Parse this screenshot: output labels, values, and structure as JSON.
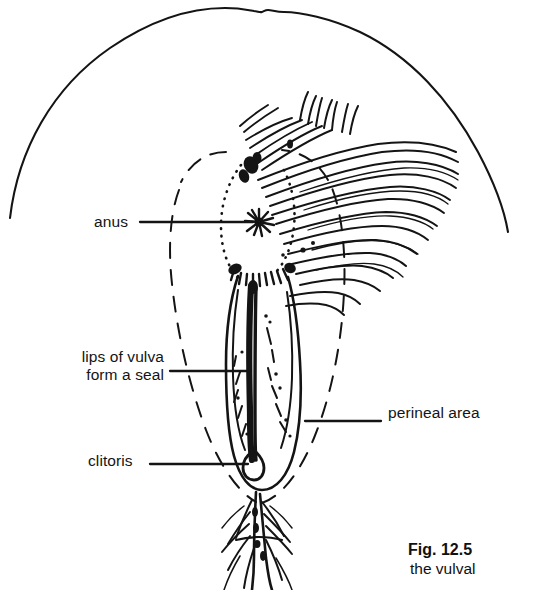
{
  "figure": {
    "title": "Fig. 12.5",
    "caption_line2": "the vulval",
    "ink_color": "#111111",
    "background_color": "#ffffff"
  },
  "labels": {
    "anus": "anus",
    "lips_of_vulva_line1": "lips of vulva",
    "lips_of_vulva_line2": "form a seal",
    "clitoris": "clitoris",
    "perineal_area": "perineal area"
  },
  "diagram": {
    "name": "vulva-anatomy-line-drawing",
    "parts": [
      "rump-outline",
      "tail-hair-fan",
      "anus-star",
      "vulva-outline",
      "vulva-slit",
      "clitoris-marker",
      "perineal-dashed-oval",
      "lower-hair-tuft"
    ]
  }
}
